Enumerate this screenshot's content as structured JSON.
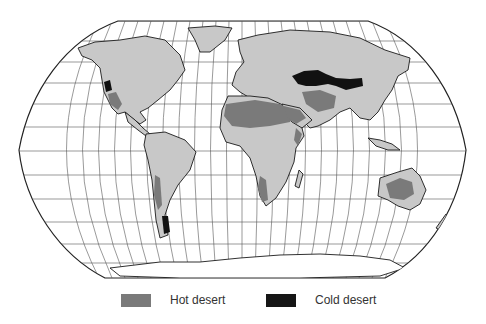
{
  "map": {
    "title": "World desert distribution",
    "projection": "Robinson",
    "colors": {
      "ocean": "#ffffff",
      "land": "#c8c8c8",
      "hot_desert": "#7a7a7a",
      "cold_desert": "#111111",
      "coastline": "#1a1a1a",
      "graticule": "#555555"
    }
  },
  "legend": {
    "items": [
      {
        "label": "Hot desert",
        "color": "#7a7a7a"
      },
      {
        "label": "Cold desert",
        "color": "#161616"
      }
    ]
  }
}
